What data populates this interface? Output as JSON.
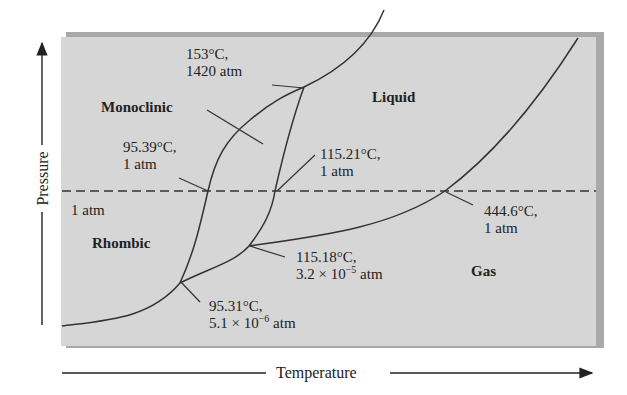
{
  "diagram": {
    "x_axis_label": "Temperature",
    "y_axis_label": "Pressure",
    "reference_line_label": "1 atm",
    "regions": {
      "monoclinic": "Monoclinic",
      "liquid": "Liquid",
      "rhombic": "Rhombic",
      "gas": "Gas"
    },
    "points": [
      {
        "temp": "153°C,",
        "pressure": "1420 atm"
      },
      {
        "temp": "95.39°C,",
        "pressure": "1 atm"
      },
      {
        "temp": "115.21°C,",
        "pressure": "1 atm"
      },
      {
        "temp": "444.6°C,",
        "pressure": "1 atm"
      },
      {
        "temp": "115.18°C,",
        "pressure_mantissa": "3.2 × 10",
        "pressure_exp": "−5",
        "pressure_unit": " atm"
      },
      {
        "temp": "95.31°C,",
        "pressure_mantissa": "5.1 × 10",
        "pressure_exp": "−6",
        "pressure_unit": " atm"
      }
    ],
    "colors": {
      "background": "#d6d6d6",
      "line": "#333333",
      "shadow": "#a8a8a8"
    }
  }
}
